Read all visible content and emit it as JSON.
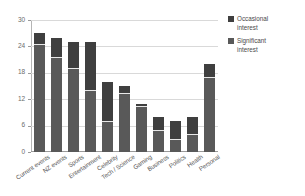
{
  "chart_data": {
    "type": "bar",
    "subtype": "stacked-vertical",
    "title": "",
    "xlabel": "",
    "ylabel": "",
    "ylim": [
      0,
      30
    ],
    "yticks": [
      0,
      6,
      12,
      18,
      24,
      30
    ],
    "ytick_labels": [
      "0",
      "6",
      "12",
      "18",
      "24",
      "30"
    ],
    "grid": true,
    "grid_axis": "y",
    "legend_position": "right",
    "categories": [
      "Current events",
      "NZ events",
      "Sports",
      "Entertainment",
      "Celebrity",
      "Tech / Science",
      "Gaming",
      "Business",
      "Politics",
      "Health",
      "Personal"
    ],
    "series": [
      {
        "name": "Significant interest",
        "color": "#595959",
        "values": [
          24.5,
          21.5,
          19.0,
          14.0,
          7.0,
          13.5,
          10.5,
          5.0,
          3.0,
          4.0,
          17.0
        ]
      },
      {
        "name": "Occasional interest",
        "color": "#3f3f3f",
        "values": [
          2.5,
          4.5,
          6.0,
          11.0,
          9.0,
          1.5,
          0.5,
          3.0,
          4.0,
          4.0,
          3.0
        ]
      }
    ],
    "totals": [
      27.0,
      26.0,
      25.0,
      25.0,
      16.0,
      15.0,
      11.0,
      8.0,
      7.0,
      8.0,
      20.0
    ]
  },
  "legend": {
    "items": [
      {
        "label_line1": "Occasional",
        "label_line2": "interest",
        "color": "#3f3f3f"
      },
      {
        "label_line1": "Significant",
        "label_line2": "interest",
        "color": "#595959"
      }
    ]
  },
  "colors": {
    "occasional": "#3f3f3f",
    "significant": "#595959",
    "gridline": "#d9d9d9",
    "axis": "#9a9a9a",
    "text": "#555555",
    "background": "#ffffff"
  }
}
